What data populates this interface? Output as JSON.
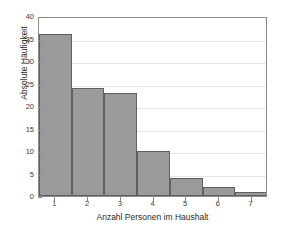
{
  "chart_data": {
    "type": "bar",
    "title": "",
    "xlabel": "Anzahl Personen im Haushalt",
    "ylabel": "Absolute Häufigkeit",
    "categories": [
      "1",
      "2",
      "3",
      "4",
      "5",
      "6",
      "7"
    ],
    "values": [
      36,
      24,
      23,
      10,
      4,
      2,
      1
    ],
    "xtick_labels": [
      "1",
      "2",
      "3",
      "4",
      "5",
      "6",
      "7"
    ],
    "ytick_labels": [
      "0",
      "5",
      "10",
      "15",
      "20",
      "25",
      "30",
      "35",
      "40"
    ],
    "ytick_values": [
      0,
      5,
      10,
      15,
      20,
      25,
      30,
      35,
      40
    ],
    "ylim": [
      0,
      40
    ],
    "xlim": [
      0.5,
      7.5
    ],
    "grid": true,
    "legend": null,
    "bar_color": "#9a9a9a",
    "bar_edge_color": "#606060",
    "axes_color": "#8c8c8c",
    "grid_color": "#e6e6e6",
    "background_color": "#ffffff"
  }
}
